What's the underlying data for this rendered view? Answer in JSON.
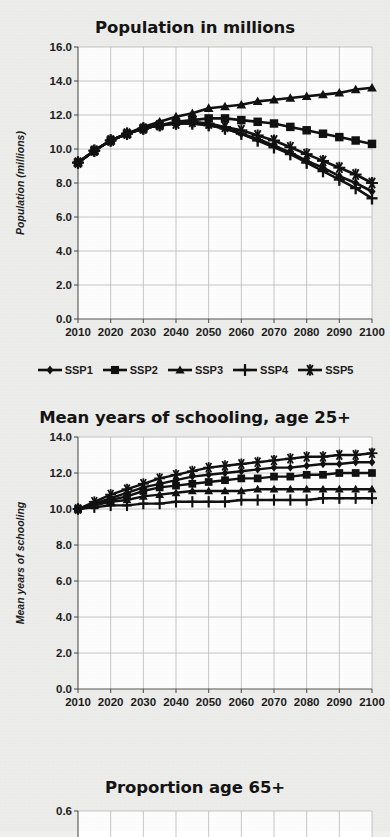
{
  "figure": {
    "background_color": "#eeeeec",
    "ink_color": "#111111",
    "grid_color": "#b9b9b9",
    "axis_color": "#555555"
  },
  "legend": {
    "position": "below-first-chart",
    "items": [
      {
        "label": "SSP1",
        "marker": "diamond"
      },
      {
        "label": "SSP2",
        "marker": "square"
      },
      {
        "label": "SSP3",
        "marker": "triangle"
      },
      {
        "label": "SSP4",
        "marker": "plus"
      },
      {
        "label": "SSP5",
        "marker": "asterisk"
      }
    ]
  },
  "chart_data": [
    {
      "type": "line",
      "title": "Population in millions",
      "xlabel": "",
      "ylabel": "Population (millions)",
      "x": [
        2010,
        2015,
        2020,
        2025,
        2030,
        2035,
        2040,
        2045,
        2050,
        2055,
        2060,
        2065,
        2070,
        2075,
        2080,
        2085,
        2090,
        2095,
        2100
      ],
      "xlim": [
        2010,
        2100
      ],
      "ylim": [
        0.0,
        16.0
      ],
      "xticks": [
        2010,
        2020,
        2030,
        2040,
        2050,
        2060,
        2070,
        2080,
        2090,
        2100
      ],
      "yticks": [
        "0.0",
        "2.0",
        "4.0",
        "6.0",
        "8.0",
        "10.0",
        "12.0",
        "14.0",
        "16.0"
      ],
      "grid": true,
      "series": [
        {
          "name": "SSP1",
          "marker": "diamond",
          "values": [
            9.2,
            9.9,
            10.5,
            10.9,
            11.2,
            11.4,
            11.5,
            11.5,
            11.4,
            11.2,
            10.9,
            10.6,
            10.2,
            9.8,
            9.3,
            8.9,
            8.4,
            8.0,
            7.5
          ]
        },
        {
          "name": "SSP2",
          "marker": "square",
          "values": [
            9.2,
            9.9,
            10.5,
            10.9,
            11.2,
            11.4,
            11.6,
            11.7,
            11.8,
            11.8,
            11.7,
            11.6,
            11.5,
            11.3,
            11.1,
            10.9,
            10.7,
            10.5,
            10.3
          ]
        },
        {
          "name": "SSP3",
          "marker": "triangle",
          "values": [
            9.2,
            9.9,
            10.5,
            10.9,
            11.3,
            11.6,
            11.9,
            12.1,
            12.4,
            12.5,
            12.6,
            12.8,
            12.9,
            13.0,
            13.1,
            13.2,
            13.3,
            13.5,
            13.6
          ]
        },
        {
          "name": "SSP4",
          "marker": "plus",
          "values": [
            9.2,
            9.9,
            10.5,
            10.9,
            11.2,
            11.4,
            11.5,
            11.5,
            11.4,
            11.2,
            10.9,
            10.5,
            10.1,
            9.7,
            9.2,
            8.7,
            8.2,
            7.7,
            7.1
          ]
        },
        {
          "name": "SSP5",
          "marker": "asterisk",
          "values": [
            9.2,
            9.9,
            10.5,
            10.9,
            11.2,
            11.4,
            11.5,
            11.6,
            11.5,
            11.3,
            11.1,
            10.8,
            10.5,
            10.1,
            9.7,
            9.3,
            8.9,
            8.5,
            8.0
          ]
        }
      ]
    },
    {
      "type": "line",
      "title": "Mean years of schooling, age 25+",
      "xlabel": "",
      "ylabel": "Mean years of schooling",
      "x": [
        2010,
        2015,
        2020,
        2025,
        2030,
        2035,
        2040,
        2045,
        2050,
        2055,
        2060,
        2065,
        2070,
        2075,
        2080,
        2085,
        2090,
        2095,
        2100
      ],
      "xlim": [
        2010,
        2100
      ],
      "ylim": [
        0.0,
        14.0
      ],
      "xticks": [
        2010,
        2020,
        2030,
        2040,
        2050,
        2060,
        2070,
        2080,
        2090,
        2100
      ],
      "yticks": [
        "0.0",
        "2.0",
        "4.0",
        "6.0",
        "8.0",
        "10.0",
        "12.0",
        "14.0"
      ],
      "grid": true,
      "series": [
        {
          "name": "SSP1",
          "marker": "diamond",
          "values": [
            10.0,
            10.3,
            10.6,
            10.9,
            11.2,
            11.4,
            11.6,
            11.8,
            11.9,
            12.0,
            12.1,
            12.2,
            12.3,
            12.3,
            12.4,
            12.5,
            12.5,
            12.6,
            12.6
          ]
        },
        {
          "name": "SSP2",
          "marker": "square",
          "values": [
            10.0,
            10.2,
            10.5,
            10.7,
            11.0,
            11.2,
            11.3,
            11.4,
            11.5,
            11.6,
            11.7,
            11.7,
            11.8,
            11.8,
            11.9,
            11.9,
            12.0,
            12.0,
            12.0
          ]
        },
        {
          "name": "SSP3",
          "marker": "triangle",
          "values": [
            10.0,
            10.2,
            10.4,
            10.5,
            10.7,
            10.8,
            10.9,
            11.0,
            11.0,
            11.0,
            11.0,
            11.1,
            11.1,
            11.1,
            11.1,
            11.1,
            11.1,
            11.1,
            11.1
          ]
        },
        {
          "name": "SSP4",
          "marker": "plus",
          "values": [
            10.0,
            10.1,
            10.2,
            10.2,
            10.3,
            10.3,
            10.4,
            10.4,
            10.4,
            10.4,
            10.5,
            10.5,
            10.5,
            10.5,
            10.5,
            10.6,
            10.6,
            10.6,
            10.6
          ]
        },
        {
          "name": "SSP5",
          "marker": "asterisk",
          "values": [
            10.0,
            10.4,
            10.8,
            11.1,
            11.4,
            11.7,
            11.9,
            12.1,
            12.3,
            12.4,
            12.5,
            12.6,
            12.7,
            12.8,
            12.9,
            12.9,
            13.0,
            13.0,
            13.1
          ]
        }
      ]
    },
    {
      "type": "line",
      "title": "Proportion age 65+",
      "xlabel": "",
      "ylabel": "",
      "xlim": [
        2010,
        2100
      ],
      "ylim": [
        0.0,
        0.6
      ],
      "yticks": [
        "0.6"
      ],
      "grid": true,
      "note": "chart cropped at bottom edge of screenshot",
      "series": []
    }
  ]
}
